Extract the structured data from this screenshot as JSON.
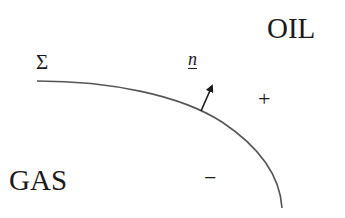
{
  "diagram": {
    "regions": {
      "upper_right": {
        "label": "OIL",
        "sign": "+"
      },
      "lower_left": {
        "label": "GAS",
        "sign": "−"
      }
    },
    "interface": {
      "label": "Σ"
    },
    "normal": {
      "label": "n"
    },
    "colors": {
      "line": "#555555",
      "text": "#1a1a1a",
      "background": "#ffffff"
    }
  }
}
